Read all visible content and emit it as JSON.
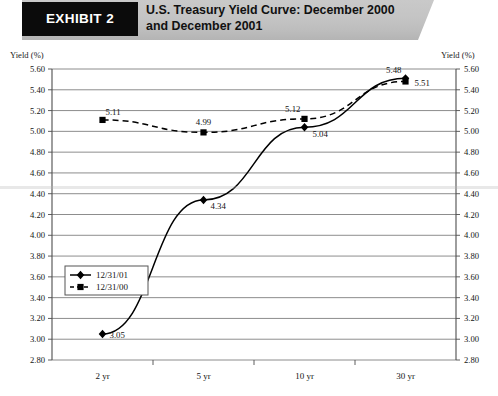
{
  "header": {
    "exhibit_tag": "EXHIBIT 2",
    "title_line1": "U.S. Treasury Yield Curve: December 2000",
    "title_line2": "and December 2001"
  },
  "axis_captions": {
    "left": "Yield (%)",
    "right": "Yield (%)"
  },
  "chart_data": {
    "type": "line",
    "title": "U.S. Treasury Yield Curve: December 2000 and December 2001",
    "xlabel": "",
    "ylabel": "Yield (%)",
    "categories": [
      "2 yr",
      "5 yr",
      "10 yr",
      "30 yr"
    ],
    "ylim": [
      2.8,
      5.6
    ],
    "ytick_step": 0.2,
    "ytick_labels": [
      "5.60",
      "5.40",
      "5.20",
      "5.00",
      "4.80",
      "4.60",
      "4.40",
      "4.20",
      "4.00",
      "3.80",
      "3.60",
      "3.40",
      "3.20",
      "3.00",
      "2.80"
    ],
    "grid": true,
    "legend_position": "inside-left",
    "series": [
      {
        "name": "12/31/01",
        "marker": "diamond",
        "line_style": "solid",
        "values": [
          3.05,
          4.34,
          5.04,
          5.51
        ],
        "point_labels": [
          "3.05",
          "4.34",
          "5.04",
          "5.51"
        ]
      },
      {
        "name": "12/31/00",
        "marker": "square",
        "line_style": "dashed",
        "values": [
          5.11,
          4.99,
          5.12,
          5.48
        ],
        "point_labels": [
          "5.11",
          "4.99",
          "5.12",
          "5.48"
        ]
      }
    ]
  },
  "colors": {
    "series_line": "#000000",
    "gridline": "#808080",
    "axis": "#4d4d4d",
    "header_tag_bg": "#0b0b0b",
    "header_band_bg": "#c4c4c4"
  }
}
